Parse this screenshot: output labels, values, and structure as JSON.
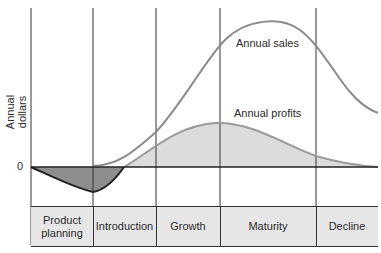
{
  "chart_data": {
    "type": "line",
    "title": "",
    "ylabel": "Annual dollars",
    "xlabel": "",
    "y_tick_labels": [
      "0"
    ],
    "stages": [
      "Product planning",
      "Introduction",
      "Growth",
      "Maturity",
      "Decline"
    ],
    "series": [
      {
        "name": "Annual sales",
        "description": "S-shaped rise from zero at start of Introduction, peaks mid-Maturity, declines through Decline",
        "x_stage_progress": [
          1.0,
          1.5,
          2.0,
          2.5,
          3.0,
          3.5,
          4.0,
          4.5,
          5.0
        ],
        "values": [
          0,
          8,
          30,
          75,
          100,
          98,
          78,
          45,
          38
        ]
      },
      {
        "name": "Annual profits",
        "description": "Negative during Product planning and Introduction, crosses zero in early Introduction/Growth, peaks at Growth/Maturity boundary, tapers to near zero in Decline",
        "x_stage_progress": [
          0.0,
          0.5,
          1.0,
          1.5,
          2.0,
          2.5,
          3.0,
          3.5,
          4.0,
          4.5,
          5.0
        ],
        "values": [
          0,
          -12,
          -18,
          0,
          15,
          26,
          30,
          22,
          12,
          5,
          1
        ]
      }
    ],
    "annotations": [
      "Annual sales",
      "Annual profits"
    ],
    "grid": "vertical stage dividers",
    "legend": "inline labels"
  },
  "labels": {
    "y_axis": "Annual dollars",
    "zero": "0",
    "sales": "Annual sales",
    "profits": "Annual profits"
  },
  "stages": [
    {
      "label": "Product planning"
    },
    {
      "label": "Introduction"
    },
    {
      "label": "Growth"
    },
    {
      "label": "Maturity"
    },
    {
      "label": "Decline"
    }
  ],
  "colors": {
    "sales_line": "#8c8c8c",
    "profit_line": "#9a9a9a",
    "profit_fill": "#dcdcdc",
    "loss_fill": "#8e8e8e",
    "loss_line": "#222222",
    "band_fill": "#e6e6e6",
    "grid": "#333333"
  }
}
